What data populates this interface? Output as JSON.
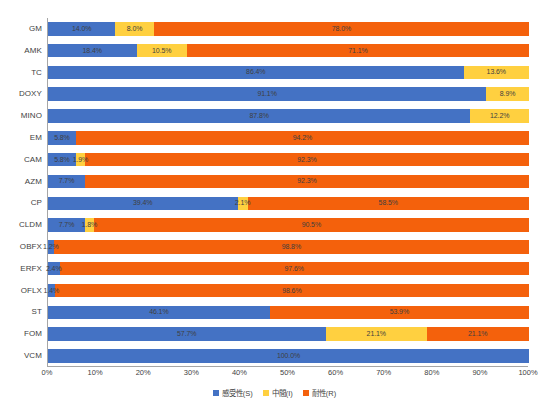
{
  "chart_data": {
    "type": "bar",
    "orientation": "horizontal",
    "stacked": true,
    "stack_mode": "percent",
    "title": "",
    "xlabel": "",
    "ylabel": "",
    "xlim": [
      0,
      100
    ],
    "grid": false,
    "legend_position": "bottom",
    "categories": [
      "GM",
      "AMK",
      "TC",
      "DOXY",
      "MINO",
      "EM",
      "CAM",
      "AZM",
      "CP",
      "CLDM",
      "OBFX",
      "ERFX",
      "OFLX",
      "ST",
      "FOM",
      "VCM"
    ],
    "series": [
      {
        "name": "感受性(S)",
        "color": "#4472c4",
        "values": [
          14.0,
          18.4,
          86.4,
          91.1,
          87.8,
          5.8,
          5.8,
          7.7,
          39.4,
          7.7,
          1.2,
          2.4,
          1.4,
          46.1,
          57.7,
          100.0
        ]
      },
      {
        "name": "中間(I)",
        "color": "#ffd040",
        "values": [
          8.0,
          10.5,
          13.6,
          8.9,
          12.2,
          0,
          1.9,
          0,
          2.1,
          1.8,
          0,
          0,
          0,
          0,
          21.1,
          0
        ]
      },
      {
        "name": "耐性(R)",
        "color": "#f4610c",
        "values": [
          78.0,
          71.1,
          0,
          0,
          0,
          94.2,
          92.3,
          92.3,
          58.5,
          90.5,
          98.8,
          97.6,
          98.6,
          53.9,
          21.1,
          0
        ]
      }
    ],
    "data_labels": [
      {
        "category": "GM",
        "segments": [
          {
            "series": "S",
            "label": "14.0%"
          },
          {
            "series": "I",
            "label": "8.0%"
          },
          {
            "series": "R",
            "label": "78.0%"
          }
        ]
      },
      {
        "category": "AMK",
        "segments": [
          {
            "series": "S",
            "label": "18.4%"
          },
          {
            "series": "I",
            "label": "10.5%"
          },
          {
            "series": "R",
            "label": "71.1%"
          }
        ]
      },
      {
        "category": "TC",
        "segments": [
          {
            "series": "S",
            "label": "86.4%"
          },
          {
            "series": "I",
            "label": "13.6%"
          },
          {
            "series": "R",
            "label": ""
          }
        ]
      },
      {
        "category": "DOXY",
        "segments": [
          {
            "series": "S",
            "label": "91.1%"
          },
          {
            "series": "I",
            "label": "8.9%"
          },
          {
            "series": "R",
            "label": ""
          }
        ]
      },
      {
        "category": "MINO",
        "segments": [
          {
            "series": "S",
            "label": "87.8%"
          },
          {
            "series": "I",
            "label": "12.2%"
          },
          {
            "series": "R",
            "label": ""
          }
        ]
      },
      {
        "category": "EM",
        "segments": [
          {
            "series": "S",
            "label": "5.8%"
          },
          {
            "series": "I",
            "label": ""
          },
          {
            "series": "R",
            "label": "94.2%"
          }
        ]
      },
      {
        "category": "CAM",
        "segments": [
          {
            "series": "S",
            "label": "5.8%"
          },
          {
            "series": "I",
            "label": "1.9%"
          },
          {
            "series": "R",
            "label": "92.3%"
          }
        ]
      },
      {
        "category": "AZM",
        "segments": [
          {
            "series": "S",
            "label": "7.7%"
          },
          {
            "series": "I",
            "label": ""
          },
          {
            "series": "R",
            "label": "92.3%"
          }
        ]
      },
      {
        "category": "CP",
        "segments": [
          {
            "series": "S",
            "label": "39.4%"
          },
          {
            "series": "I",
            "label": "2.1%"
          },
          {
            "series": "R",
            "label": "58.5%"
          }
        ]
      },
      {
        "category": "CLDM",
        "segments": [
          {
            "series": "S",
            "label": "7.7%"
          },
          {
            "series": "I",
            "label": "1.8%"
          },
          {
            "series": "R",
            "label": "90.5%"
          }
        ]
      },
      {
        "category": "OBFX",
        "segments": [
          {
            "series": "S",
            "label": "1.2%"
          },
          {
            "series": "I",
            "label": ""
          },
          {
            "series": "R",
            "label": "98.8%"
          }
        ]
      },
      {
        "category": "ERFX",
        "segments": [
          {
            "series": "S",
            "label": "2.4%"
          },
          {
            "series": "I",
            "label": ""
          },
          {
            "series": "R",
            "label": "97.6%"
          }
        ]
      },
      {
        "category": "OFLX",
        "segments": [
          {
            "series": "S",
            "label": "1.4%"
          },
          {
            "series": "I",
            "label": ""
          },
          {
            "series": "R",
            "label": "98.6%"
          }
        ]
      },
      {
        "category": "ST",
        "segments": [
          {
            "series": "S",
            "label": "46.1%"
          },
          {
            "series": "I",
            "label": ""
          },
          {
            "series": "R",
            "label": "53.9%"
          }
        ]
      },
      {
        "category": "FOM",
        "segments": [
          {
            "series": "S",
            "label": "57.7%"
          },
          {
            "series": "I",
            "label": "21.1%"
          },
          {
            "series": "R",
            "label": "21.1%"
          }
        ]
      },
      {
        "category": "VCM",
        "segments": [
          {
            "series": "S",
            "label": "100.0%"
          },
          {
            "series": "I",
            "label": ""
          },
          {
            "series": "R",
            "label": ""
          }
        ]
      }
    ],
    "xticks": [
      "0%",
      "10%",
      "20%",
      "30%",
      "40%",
      "50%",
      "60%",
      "70%",
      "80%",
      "90%",
      "100%"
    ],
    "xtick_values": [
      0,
      10,
      20,
      30,
      40,
      50,
      60,
      70,
      80,
      90,
      100
    ],
    "legend": [
      {
        "label": "感受性(S)",
        "color": "#4472c4"
      },
      {
        "label": "中間(I)",
        "color": "#ffd040"
      },
      {
        "label": "耐性(R)",
        "color": "#f4610c"
      }
    ]
  },
  "colors": {
    "susceptible": "#4472c4",
    "intermediate": "#ffd040",
    "resistant": "#f4610c",
    "axis": "#a6a6a6",
    "text": "#3f3f3f",
    "background": "#ffffff"
  }
}
